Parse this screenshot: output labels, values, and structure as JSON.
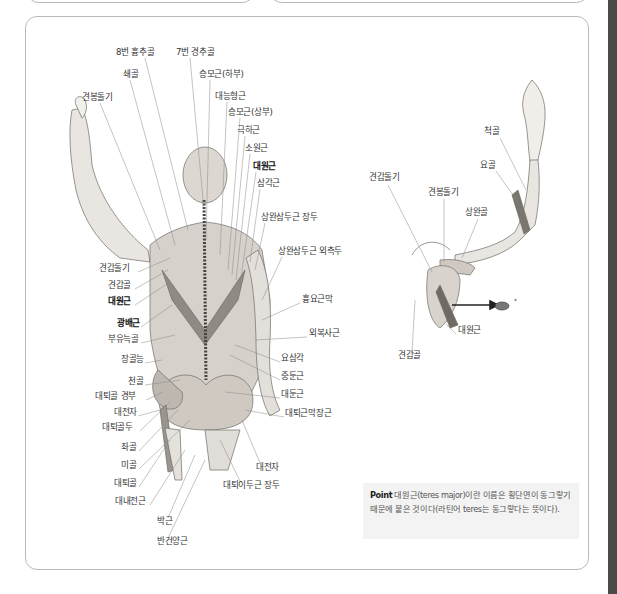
{
  "figure_back": {
    "labels": [
      {
        "id": "thoracic8",
        "text": "8번 흉추골",
        "x": 116,
        "y": 52,
        "bold": false
      },
      {
        "id": "cervical7",
        "text": "7번 경추골",
        "x": 176,
        "y": 52,
        "bold": false
      },
      {
        "id": "clavicle",
        "text": "쇄골",
        "x": 123,
        "y": 74,
        "bold": false
      },
      {
        "id": "trapezius_lower",
        "text": "승모근(하부)",
        "x": 199,
        "y": 74,
        "bold": false
      },
      {
        "id": "acromion_left",
        "text": "견봉돌기",
        "x": 82,
        "y": 97,
        "bold": false
      },
      {
        "id": "rhomboid_major",
        "text": "대능형근",
        "x": 215,
        "y": 96,
        "bold": false
      },
      {
        "id": "trapezius_upper",
        "text": "승모근(상부)",
        "x": 228,
        "y": 112,
        "bold": false
      },
      {
        "id": "infraspinatus",
        "text": "극하근",
        "x": 237,
        "y": 130,
        "bold": false
      },
      {
        "id": "teres_minor",
        "text": "소원근",
        "x": 245,
        "y": 148,
        "bold": false
      },
      {
        "id": "teres_major",
        "text": "대원근",
        "x": 253,
        "y": 166,
        "bold": true
      },
      {
        "id": "deltoid",
        "text": "삼각근",
        "x": 257,
        "y": 183,
        "bold": false
      },
      {
        "id": "triceps_long",
        "text": "상완삼두근 장두",
        "x": 261,
        "y": 217,
        "bold": false
      },
      {
        "id": "triceps_lateral",
        "text": "상완삼두근 외측두",
        "x": 278,
        "y": 251,
        "bold": false
      },
      {
        "id": "scapular_spine",
        "text": "견갑돌기",
        "x": 99,
        "y": 268,
        "bold": false
      },
      {
        "id": "scapula",
        "text": "견갑골",
        "x": 108,
        "y": 285,
        "bold": false
      },
      {
        "id": "teres_major_2",
        "text": "대원근",
        "x": 108,
        "y": 301,
        "bold": true
      },
      {
        "id": "thoracolumbar_fascia",
        "text": "흉요근막",
        "x": 302,
        "y": 299,
        "bold": false
      },
      {
        "id": "latissimus",
        "text": "광배근",
        "x": 117,
        "y": 323,
        "bold": true
      },
      {
        "id": "floating_rib",
        "text": "부유늑골",
        "x": 108,
        "y": 339,
        "bold": false
      },
      {
        "id": "external_oblique",
        "text": "외복사근",
        "x": 309,
        "y": 333,
        "bold": false
      },
      {
        "id": "iliac_crest",
        "text": "장골능",
        "x": 121,
        "y": 359,
        "bold": false
      },
      {
        "id": "lumbar_triangle",
        "text": "요삼각",
        "x": 281,
        "y": 358,
        "bold": false
      },
      {
        "id": "sacrum",
        "text": "천골",
        "x": 128,
        "y": 381,
        "bold": false
      },
      {
        "id": "gluteus_medius",
        "text": "중둔근",
        "x": 281,
        "y": 376,
        "bold": false
      },
      {
        "id": "femoral_neck",
        "text": "대퇴골 경부",
        "x": 95,
        "y": 396,
        "bold": false
      },
      {
        "id": "gluteus_maximus",
        "text": "대둔근",
        "x": 281,
        "y": 394,
        "bold": false
      },
      {
        "id": "greater_trochanter",
        "text": "대전자",
        "x": 114,
        "y": 412,
        "bold": false
      },
      {
        "id": "tfl",
        "text": "대퇴근막장근",
        "x": 285,
        "y": 413,
        "bold": false
      },
      {
        "id": "femoral_head",
        "text": "대퇴골두",
        "x": 102,
        "y": 427,
        "bold": false
      },
      {
        "id": "ischium",
        "text": "좌골",
        "x": 121,
        "y": 447,
        "bold": false
      },
      {
        "id": "coccyx",
        "text": "미골",
        "x": 121,
        "y": 465,
        "bold": false
      },
      {
        "id": "greater_trochanter_2",
        "text": "대전자",
        "x": 256,
        "y": 467,
        "bold": false
      },
      {
        "id": "femur",
        "text": "대퇴골",
        "x": 114,
        "y": 483,
        "bold": false
      },
      {
        "id": "biceps_femoris",
        "text": "대퇴이두근 장두",
        "x": 223,
        "y": 485,
        "bold": false
      },
      {
        "id": "adductor_magnus",
        "text": "대내전근",
        "x": 115,
        "y": 501,
        "bold": false
      },
      {
        "id": "gracilis",
        "text": "박근",
        "x": 157,
        "y": 521,
        "bold": false
      },
      {
        "id": "semitendinosus",
        "text": "반건양근",
        "x": 157,
        "y": 541,
        "bold": false
      }
    ]
  },
  "figure_arm": {
    "labels": [
      {
        "id": "ulna",
        "text": "척골",
        "x": 484,
        "y": 131,
        "bold": false
      },
      {
        "id": "radius",
        "text": "요골",
        "x": 480,
        "y": 165,
        "bold": false
      },
      {
        "id": "scapular_spine",
        "text": "견갑돌기",
        "x": 369,
        "y": 177,
        "bold": false
      },
      {
        "id": "acromion",
        "text": "견봉돌기",
        "x": 428,
        "y": 192,
        "bold": false
      },
      {
        "id": "humerus",
        "text": "상완골",
        "x": 465,
        "y": 212,
        "bold": false
      },
      {
        "id": "teres_major",
        "text": "대원근",
        "x": 458,
        "y": 330,
        "bold": false
      },
      {
        "id": "scapula",
        "text": "견갑골",
        "x": 398,
        "y": 355,
        "bold": false
      }
    ],
    "cross_section_marker": "*"
  },
  "point_box": {
    "prefix": "Point",
    "text": "대원근(teres major)이란 이름은 횡단면이 동그랗기 때문에 붙은 것이다(라틴어 teres는 동그랗다는 뜻이다)."
  }
}
